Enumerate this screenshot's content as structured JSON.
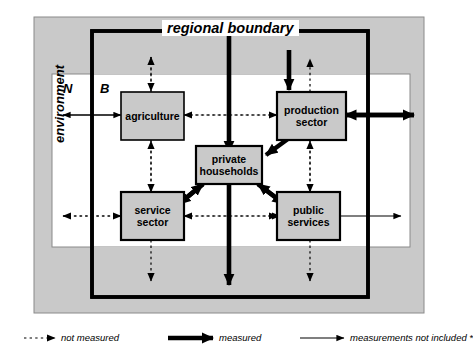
{
  "diagram": {
    "title_label": "regional boundary",
    "environment_label": "environment",
    "zone_labels": {
      "outside": "N",
      "inside": "B"
    },
    "nodes": [
      {
        "id": "agriculture",
        "label": "agriculture"
      },
      {
        "id": "production-sector",
        "label": "production sector"
      },
      {
        "id": "private-households",
        "label": "private households"
      },
      {
        "id": "service-sector",
        "label": "service sector"
      },
      {
        "id": "public-services",
        "label": "public services"
      }
    ],
    "legend": [
      {
        "id": "not-measured",
        "label": "not measured",
        "style": "dotted"
      },
      {
        "id": "measured",
        "label": "measured",
        "style": "thick"
      },
      {
        "id": "measurements-not-included",
        "label": "measurements not included *",
        "style": "thin"
      }
    ],
    "colors": {
      "environment_fill": "#c9c9c9",
      "inner_fill": "#ffffff",
      "node_fill": "#c9c9c9",
      "stroke": "#000000"
    }
  }
}
